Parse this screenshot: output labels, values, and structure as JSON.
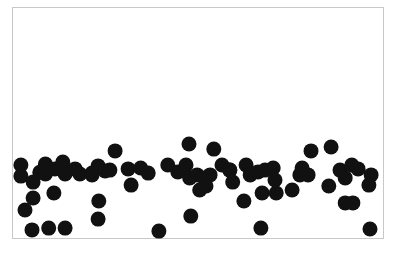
{
  "chart_data": {
    "type": "scatter",
    "title": "",
    "xlabel": "",
    "ylabel": "",
    "xlim": [
      0,
      100
    ],
    "ylim": [
      0,
      100
    ],
    "grid": false,
    "legend": null,
    "frame": {
      "left": 12,
      "top": 7,
      "right": 383,
      "bottom": 238,
      "color": "#c8c8c8"
    },
    "marker": {
      "color": "#111111",
      "radius": 7.5
    },
    "series": [
      {
        "name": "points",
        "points": [
          [
            2.4,
            31.6
          ],
          [
            2.4,
            26.8
          ],
          [
            5.7,
            24.2
          ],
          [
            7.5,
            28.5
          ],
          [
            3.5,
            12.1
          ],
          [
            5.7,
            17.3
          ],
          [
            5.4,
            3.5
          ],
          [
            9.9,
            4.3
          ],
          [
            14.3,
            4.3
          ],
          [
            11.3,
            19.5
          ],
          [
            9.0,
            32.0
          ],
          [
            9.0,
            27.7
          ],
          [
            11.6,
            29.9
          ],
          [
            13.7,
            32.9
          ],
          [
            14.3,
            27.7
          ],
          [
            17.0,
            29.9
          ],
          [
            18.3,
            27.7
          ],
          [
            21.6,
            28.1
          ],
          [
            21.6,
            27.3
          ],
          [
            23.2,
            31.2
          ],
          [
            27.8,
            37.7
          ],
          [
            25.1,
            29.0
          ],
          [
            26.4,
            29.4
          ],
          [
            31.3,
            29.9
          ],
          [
            34.7,
            30.3
          ],
          [
            36.7,
            28.1
          ],
          [
            32.1,
            22.9
          ],
          [
            23.4,
            16.0
          ],
          [
            23.2,
            8.2
          ],
          [
            39.6,
            3.0
          ],
          [
            47.7,
            40.7
          ],
          [
            54.4,
            38.5
          ],
          [
            42.0,
            31.6
          ],
          [
            44.7,
            28.6
          ],
          [
            46.9,
            31.6
          ],
          [
            47.9,
            26.0
          ],
          [
            49.9,
            27.3
          ],
          [
            51.8,
            26.0
          ],
          [
            53.4,
            27.3
          ],
          [
            50.6,
            20.8
          ],
          [
            52.3,
            22.5
          ],
          [
            56.6,
            31.6
          ],
          [
            58.7,
            29.4
          ],
          [
            48.2,
            9.5
          ],
          [
            58.7,
            29.4
          ],
          [
            59.5,
            24.2
          ],
          [
            63.1,
            31.6
          ],
          [
            64.2,
            27.3
          ],
          [
            66.3,
            28.6
          ],
          [
            68.2,
            29.4
          ],
          [
            70.4,
            30.3
          ],
          [
            70.9,
            25.1
          ],
          [
            62.5,
            16.0
          ],
          [
            67.4,
            19.5
          ],
          [
            71.2,
            19.5
          ],
          [
            75.5,
            20.8
          ],
          [
            67.1,
            4.3
          ],
          [
            77.6,
            27.3
          ],
          [
            80.6,
            37.7
          ],
          [
            86.0,
            39.4
          ],
          [
            78.2,
            30.3
          ],
          [
            79.8,
            27.3
          ],
          [
            85.4,
            22.5
          ],
          [
            88.4,
            29.4
          ],
          [
            89.8,
            26.0
          ],
          [
            91.6,
            31.6
          ],
          [
            93.3,
            29.9
          ],
          [
            96.8,
            27.3
          ],
          [
            96.2,
            22.9
          ],
          [
            89.8,
            15.2
          ],
          [
            91.9,
            15.2
          ],
          [
            96.5,
            3.9
          ]
        ]
      }
    ]
  }
}
